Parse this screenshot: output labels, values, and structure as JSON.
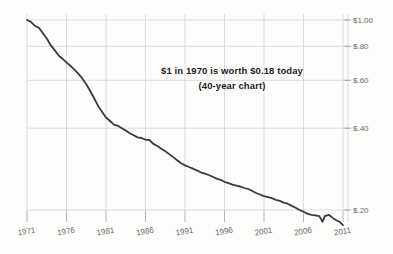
{
  "chart_data": {
    "type": "line",
    "annotation": {
      "line1": "$1 in 1970 is worth $0.18 today",
      "line2": "(40-year chart)"
    },
    "series_name": "purchasing-power-of-1970-dollar",
    "x": [
      1971,
      1971.5,
      1972,
      1972.5,
      1973,
      1973.5,
      1974,
      1974.5,
      1975,
      1975.5,
      1976,
      1976.5,
      1977,
      1977.5,
      1978,
      1978.5,
      1979,
      1979.5,
      1980,
      1980.5,
      1981,
      1981.5,
      1982,
      1982.5,
      1983,
      1983.5,
      1984,
      1984.5,
      1985,
      1985.5,
      1986,
      1986.5,
      1987,
      1987.5,
      1988,
      1988.5,
      1989,
      1989.5,
      1990,
      1990.5,
      1991,
      1991.5,
      1992,
      1992.5,
      1993,
      1993.5,
      1994,
      1994.5,
      1995,
      1995.5,
      1996,
      1996.5,
      1997,
      1997.5,
      1998,
      1998.5,
      1999,
      1999.5,
      2000,
      2000.5,
      2001,
      2001.5,
      2002,
      2002.5,
      2003,
      2003.5,
      2004,
      2004.5,
      2005,
      2005.5,
      2006,
      2006.5,
      2007,
      2007.5,
      2008,
      2008.4,
      2008.7,
      2009.2,
      2009.7,
      2010.2,
      2010.6,
      2011
    ],
    "values": [
      1.0,
      0.985,
      0.952,
      0.935,
      0.896,
      0.855,
      0.807,
      0.775,
      0.74,
      0.72,
      0.699,
      0.678,
      0.657,
      0.635,
      0.61,
      0.58,
      0.548,
      0.515,
      0.483,
      0.46,
      0.438,
      0.425,
      0.412,
      0.408,
      0.4,
      0.392,
      0.383,
      0.377,
      0.37,
      0.368,
      0.363,
      0.362,
      0.35,
      0.344,
      0.336,
      0.329,
      0.321,
      0.313,
      0.305,
      0.297,
      0.292,
      0.288,
      0.284,
      0.28,
      0.275,
      0.272,
      0.269,
      0.265,
      0.261,
      0.258,
      0.254,
      0.251,
      0.248,
      0.246,
      0.244,
      0.241,
      0.239,
      0.235,
      0.231,
      0.228,
      0.225,
      0.223,
      0.221,
      0.218,
      0.216,
      0.213,
      0.211,
      0.207,
      0.204,
      0.2,
      0.197,
      0.194,
      0.192,
      0.191,
      0.19,
      0.181,
      0.19,
      0.192,
      0.187,
      0.183,
      0.181,
      0.176
    ],
    "x_axis": {
      "tick_labels": [
        "1971",
        "1976",
        "1981",
        "1986",
        "1991",
        "1996",
        "2001",
        "2006",
        "2011"
      ],
      "tick_years": [
        1971,
        1976,
        1981,
        1986,
        1991,
        1996,
        2001,
        2006,
        2011
      ],
      "range": [
        1971,
        2011
      ]
    },
    "y_axis": {
      "tick_labels": [
        "$1.00",
        "$.80",
        "$.60",
        "$.40",
        "$.20"
      ],
      "tick_values": [
        1.0,
        0.8,
        0.6,
        0.4,
        0.2
      ],
      "scale": "log",
      "side": "right"
    },
    "grid": true,
    "legend": "none",
    "style": {
      "line_color": "#3a3a3a",
      "grid_color": "#dbdbe1",
      "tick_color": "#9f9f9f",
      "label_color": "#6b6b6b",
      "annotation_color": "#1d1d1d",
      "background": "#fdfdfb"
    }
  }
}
